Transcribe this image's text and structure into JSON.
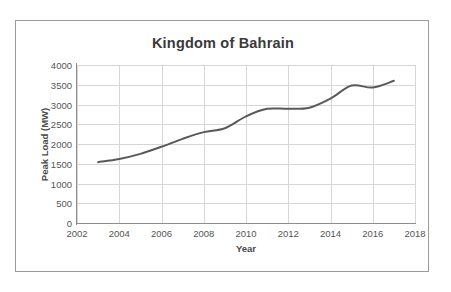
{
  "chart_data": {
    "type": "line",
    "title": "Kingdom of Bahrain",
    "xlabel": "Year",
    "ylabel": "Peak Load (MW)",
    "xlim": [
      2002,
      2018
    ],
    "ylim": [
      0,
      4000
    ],
    "xticks": [
      2002,
      2004,
      2006,
      2008,
      2010,
      2012,
      2014,
      2016,
      2018
    ],
    "xtick_labels": [
      "2002",
      "2004",
      "2006",
      "2008",
      "2010",
      "2012",
      "2014",
      "2016",
      "2018"
    ],
    "yticks": [
      0,
      500,
      1000,
      1500,
      2000,
      2500,
      3000,
      3500,
      4000
    ],
    "ytick_labels": [
      "0",
      "500",
      "1000",
      "1500",
      "2000",
      "2500",
      "3000",
      "3500",
      "4000"
    ],
    "grid": true,
    "legend": false,
    "line_color": "#595959",
    "series": [
      {
        "name": "Peak Load",
        "x": [
          2003,
          2004,
          2005,
          2006,
          2007,
          2008,
          2009,
          2010,
          2011,
          2012,
          2013,
          2014,
          2015,
          2016,
          2017
        ],
        "values": [
          1540,
          1620,
          1750,
          1930,
          2130,
          2300,
          2400,
          2700,
          2890,
          2890,
          2920,
          3150,
          3480,
          3430,
          3600
        ]
      }
    ]
  }
}
